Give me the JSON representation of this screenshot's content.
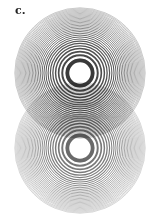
{
  "figure": {
    "label": "c.",
    "background_color": "#ffffff",
    "patterns": [
      {
        "name": "upper-zone-plate",
        "ring_color": "#3a3a3a",
        "zone_count": 30,
        "center_opacity": 1.0
      },
      {
        "name": "lower-zone-plate",
        "ring_color": "#6a6a6a",
        "zone_count": 30,
        "center_opacity": 1.0
      }
    ]
  }
}
